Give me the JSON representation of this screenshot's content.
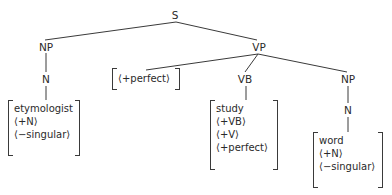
{
  "tree": {
    "root": "S",
    "subject": {
      "np": "NP",
      "n": "N",
      "features": [
        "etymologist",
        "⟨+N⟩",
        "⟨−singular⟩"
      ]
    },
    "predicate": {
      "vp": "VP",
      "aux_features": [
        "[⟨+perfect⟩]"
      ],
      "vb": "VB",
      "vb_features": [
        "study",
        "⟨+VB⟩",
        "⟨+V⟩",
        "⟨+perfect⟩"
      ],
      "object": {
        "np": "NP",
        "n": "N",
        "features": [
          "word",
          "⟨+N⟩",
          "⟨−singular⟩"
        ]
      }
    }
  }
}
